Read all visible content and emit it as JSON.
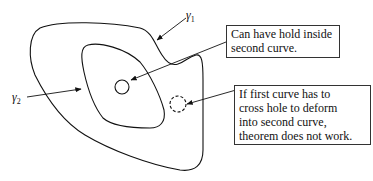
{
  "diagram": {
    "curves": [
      {
        "id": "gamma1",
        "label": "γ",
        "subscript": "1",
        "description": "outer curve"
      },
      {
        "id": "gamma2",
        "label": "γ",
        "subscript": "2",
        "description": "inner curve"
      }
    ],
    "holes": [
      {
        "id": "hole-inside",
        "style": "solid"
      },
      {
        "id": "hole-outside",
        "style": "dashed"
      }
    ],
    "callouts": [
      {
        "id": "callout-hole-inside",
        "text": "Can have hold inside\nsecond curve."
      },
      {
        "id": "callout-hole-crossing",
        "text": "If first curve has to\ncross hole to deform\ninto second curve,\ntheorem does not work."
      }
    ],
    "colors": {
      "stroke": "#111111",
      "background": "#ffffff"
    }
  }
}
